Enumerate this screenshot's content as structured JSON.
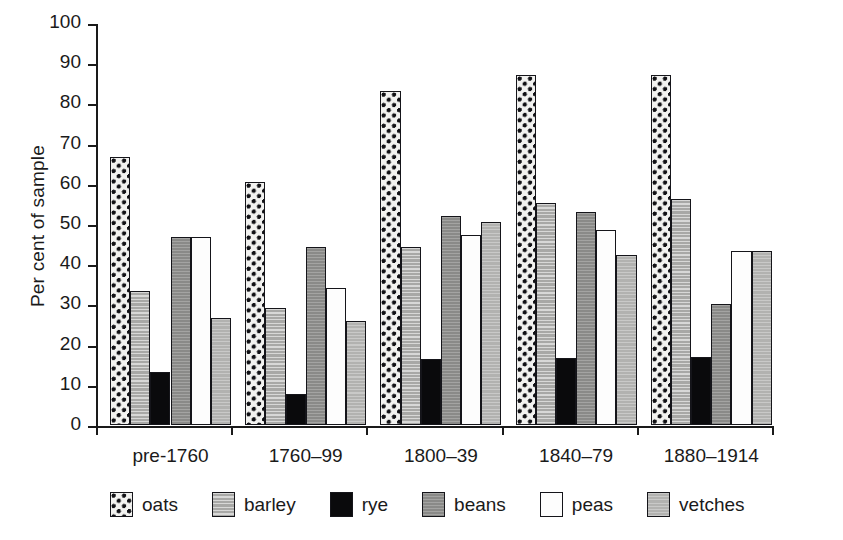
{
  "chart_data": {
    "type": "bar",
    "title": "",
    "subtitle": "",
    "xlabel": "",
    "ylabel": "Per cent of sample",
    "ylim": [
      0,
      100
    ],
    "ytick_step": 10,
    "yticks": [
      "100",
      "90",
      "80",
      "70",
      "60",
      "50",
      "40",
      "30",
      "20",
      "10",
      "0"
    ],
    "grid": false,
    "legend_position": "bottom",
    "categories": [
      "pre-1760",
      "1760–99",
      "1800–39",
      "1840–79",
      "1880–1914"
    ],
    "series": [
      {
        "name": "oats",
        "values": [
          66.7,
          60.5,
          83.0,
          87.0,
          87.0
        ]
      },
      {
        "name": "barley",
        "values": [
          33.3,
          29.0,
          44.3,
          55.2,
          56.3
        ]
      },
      {
        "name": "rye",
        "values": [
          13.2,
          7.8,
          16.4,
          16.7,
          16.9
        ]
      },
      {
        "name": "beans",
        "values": [
          46.8,
          44.3,
          52.0,
          53.0,
          30.2
        ]
      },
      {
        "name": "peas",
        "values": [
          46.8,
          34.1,
          47.2,
          48.6,
          43.2
        ]
      },
      {
        "name": "vetches",
        "values": [
          26.6,
          25.9,
          50.6,
          42.2,
          43.2
        ]
      }
    ],
    "colors": {
      "oats": "#f2f2f0",
      "barley": "#a8a8a6",
      "rye": "#0a0a0c",
      "beans": "#8a8a88",
      "peas": "#fdfdfd",
      "vetches": "#b2b2b0",
      "axis": "#1a1a1a",
      "background": "#ffffff"
    },
    "patterns": {
      "oats": "checkered-dots",
      "barley": "horizontal-lines-light",
      "rye": "solid-black",
      "beans": "horizontal-lines-dark-gray",
      "peas": "solid-white",
      "vetches": "horizontal-lines-medium-gray"
    }
  },
  "legend": {
    "items": [
      {
        "label": "oats",
        "key": "oats"
      },
      {
        "label": "barley",
        "key": "barley"
      },
      {
        "label": "rye",
        "key": "rye"
      },
      {
        "label": "beans",
        "key": "beans"
      },
      {
        "label": "peas",
        "key": "peas"
      },
      {
        "label": "vetches",
        "key": "vetches"
      }
    ]
  }
}
